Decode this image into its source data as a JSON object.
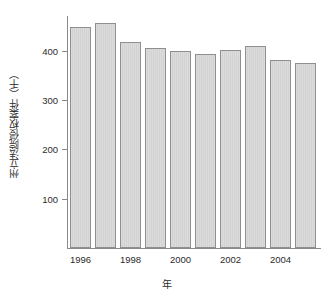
{
  "chart_data": {
    "type": "bar",
    "title": "",
    "xlabel": "年",
    "ylabel": "州立法院侵权案件（千）",
    "categories": [
      1996,
      1997,
      1998,
      1999,
      2000,
      2001,
      2002,
      2003,
      2004,
      2005
    ],
    "values": [
      448,
      455,
      418,
      406,
      400,
      393,
      402,
      409,
      381,
      375
    ],
    "ylim": [
      0,
      470
    ],
    "yticks": [
      100,
      200,
      300,
      400
    ],
    "ytick_labels": [
      "100",
      "200",
      "300",
      "400"
    ],
    "xticks": [
      1996,
      1998,
      2000,
      2002,
      2004
    ],
    "xtick_labels": [
      "1996",
      "1998",
      "2000",
      "2002",
      "2004"
    ],
    "grid": false,
    "legend": null,
    "bar_color": "#d8d8d8",
    "bar_edge_color": "#8f8f8f",
    "axis_color": "#8a8a8a",
    "text_color": "#2b2b2b"
  },
  "layout": {
    "plot_left": 68,
    "plot_right": 318,
    "plot_top": 16,
    "plot_bottom": 248,
    "bar_width_px": 21,
    "ylabel_box_left": 4,
    "xlabel_top": 276,
    "xtick_labels_top": 254
  }
}
